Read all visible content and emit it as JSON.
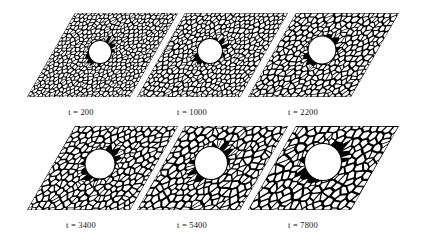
{
  "figure": {
    "kind": "grain-growth-simulation-montage",
    "background_color": "#ffffff",
    "line_color": "#000000",
    "cell_fill_color": "#ffffff",
    "void_fill_color": "#ffffff",
    "rows": 2,
    "columns": 3,
    "shear_description": "each simulation cell is drawn as a sheared parallelogram (top edge offset to the right of the bottom edge)",
    "panels": [
      {
        "id": "panel-t-200",
        "caption": "t = 200",
        "time_value": 200,
        "row": 0,
        "column": 0,
        "caption_x": 81,
        "caption_y": 107,
        "origin_x": 27,
        "origin_y": 97,
        "width": 103,
        "height": 84,
        "shear_x": 48,
        "void_cx": 100,
        "void_cy": 52,
        "void_r": 11.5,
        "grain_size": 4.2,
        "jitter": 0.42,
        "seed": 1201
      },
      {
        "id": "panel-t-1000",
        "caption": "t = 1000",
        "time_value": 1000,
        "row": 0,
        "column": 1,
        "caption_x": 192,
        "caption_y": 107,
        "origin_x": 137,
        "origin_y": 97,
        "width": 103,
        "height": 84,
        "shear_x": 48,
        "void_cx": 210,
        "void_cy": 51,
        "void_r": 12.5,
        "grain_size": 4.8,
        "jitter": 0.44,
        "seed": 1002
      },
      {
        "id": "panel-t-2200",
        "caption": "t = 2200",
        "time_value": 2200,
        "row": 0,
        "column": 2,
        "caption_x": 303,
        "caption_y": 107,
        "origin_x": 248,
        "origin_y": 97,
        "width": 103,
        "height": 84,
        "shear_x": 48,
        "void_cx": 322,
        "void_cy": 50,
        "void_r": 14.0,
        "grain_size": 5.6,
        "jitter": 0.45,
        "seed": 2203
      },
      {
        "id": "panel-t-3400",
        "caption": "t = 3400",
        "time_value": 3400,
        "row": 1,
        "column": 0,
        "caption_x": 81,
        "caption_y": 220,
        "origin_x": 27,
        "origin_y": 210,
        "width": 103,
        "height": 84,
        "shear_x": 48,
        "void_cx": 100,
        "void_cy": 164,
        "void_r": 15.0,
        "grain_size": 6.3,
        "jitter": 0.46,
        "seed": 3404
      },
      {
        "id": "panel-t-5400",
        "caption": "t = 5400",
        "time_value": 5400,
        "row": 1,
        "column": 1,
        "caption_x": 192,
        "caption_y": 220,
        "origin_x": 137,
        "origin_y": 210,
        "width": 103,
        "height": 84,
        "shear_x": 48,
        "void_cx": 211,
        "void_cy": 163,
        "void_r": 16.5,
        "grain_size": 7.0,
        "jitter": 0.47,
        "seed": 5405
      },
      {
        "id": "panel-t-7800",
        "caption": "t = 7800",
        "time_value": 7800,
        "row": 1,
        "column": 2,
        "caption_x": 303,
        "caption_y": 220,
        "origin_x": 248,
        "origin_y": 210,
        "width": 103,
        "height": 84,
        "shear_x": 48,
        "void_cx": 323,
        "void_cy": 162,
        "void_r": 18.5,
        "grain_size": 7.9,
        "jitter": 0.48,
        "seed": 7806
      }
    ]
  }
}
